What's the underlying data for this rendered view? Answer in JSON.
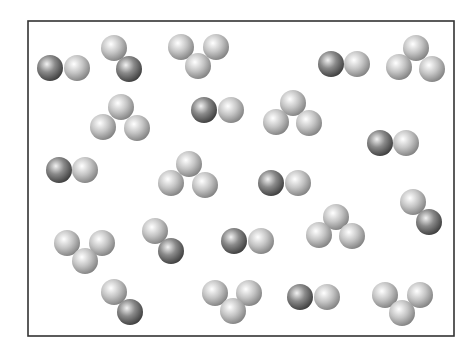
{
  "diagram": {
    "type": "particle-box",
    "box": {
      "x": 28,
      "y": 21,
      "width": 426,
      "height": 315,
      "stroke": "#333333"
    },
    "atom_radius": 13,
    "atom_types": {
      "dark": {
        "highlight": "#f2f2f2",
        "mid": "#8a8a8a",
        "edge": "#3a3a3a"
      },
      "light": {
        "highlight": "#ffffff",
        "mid": "#c4c4c4",
        "edge": "#7e7e7e"
      }
    },
    "molecules": [
      {
        "id": "m1",
        "kind": "diatomic-AB",
        "atoms": [
          {
            "x": 50,
            "y": 68,
            "t": "dark"
          },
          {
            "x": 77,
            "y": 68,
            "t": "light"
          }
        ]
      },
      {
        "id": "m2",
        "kind": "diatomic-AB",
        "atoms": [
          {
            "x": 114,
            "y": 48,
            "t": "light"
          },
          {
            "x": 129,
            "y": 69,
            "t": "dark"
          }
        ]
      },
      {
        "id": "m3",
        "kind": "triatomic-B3",
        "atoms": [
          {
            "x": 181,
            "y": 47,
            "t": "light"
          },
          {
            "x": 216,
            "y": 47,
            "t": "light"
          },
          {
            "x": 198,
            "y": 66,
            "t": "light"
          }
        ]
      },
      {
        "id": "m4",
        "kind": "diatomic-AB",
        "atoms": [
          {
            "x": 331,
            "y": 64,
            "t": "dark"
          },
          {
            "x": 357,
            "y": 64,
            "t": "light"
          }
        ]
      },
      {
        "id": "m5",
        "kind": "triatomic-B3",
        "atoms": [
          {
            "x": 416,
            "y": 48,
            "t": "light"
          },
          {
            "x": 399,
            "y": 67,
            "t": "light"
          },
          {
            "x": 432,
            "y": 69,
            "t": "light"
          }
        ]
      },
      {
        "id": "m6",
        "kind": "triatomic-B3",
        "atoms": [
          {
            "x": 121,
            "y": 107,
            "t": "light"
          },
          {
            "x": 103,
            "y": 127,
            "t": "light"
          },
          {
            "x": 137,
            "y": 128,
            "t": "light"
          }
        ]
      },
      {
        "id": "m7",
        "kind": "diatomic-AB",
        "atoms": [
          {
            "x": 204,
            "y": 110,
            "t": "dark"
          },
          {
            "x": 231,
            "y": 110,
            "t": "light"
          }
        ]
      },
      {
        "id": "m8",
        "kind": "triatomic-B3",
        "atoms": [
          {
            "x": 293,
            "y": 103,
            "t": "light"
          },
          {
            "x": 276,
            "y": 122,
            "t": "light"
          },
          {
            "x": 309,
            "y": 123,
            "t": "light"
          }
        ]
      },
      {
        "id": "m9",
        "kind": "diatomic-AB",
        "atoms": [
          {
            "x": 380,
            "y": 143,
            "t": "dark"
          },
          {
            "x": 406,
            "y": 143,
            "t": "light"
          }
        ]
      },
      {
        "id": "m10",
        "kind": "diatomic-AB",
        "atoms": [
          {
            "x": 59,
            "y": 170,
            "t": "dark"
          },
          {
            "x": 85,
            "y": 170,
            "t": "light"
          }
        ]
      },
      {
        "id": "m11",
        "kind": "triatomic-B3",
        "atoms": [
          {
            "x": 189,
            "y": 164,
            "t": "light"
          },
          {
            "x": 171,
            "y": 183,
            "t": "light"
          },
          {
            "x": 205,
            "y": 185,
            "t": "light"
          }
        ]
      },
      {
        "id": "m12",
        "kind": "diatomic-AB",
        "atoms": [
          {
            "x": 271,
            "y": 183,
            "t": "dark"
          },
          {
            "x": 298,
            "y": 183,
            "t": "light"
          }
        ]
      },
      {
        "id": "m13",
        "kind": "triatomic-B3",
        "atoms": [
          {
            "x": 336,
            "y": 217,
            "t": "light"
          },
          {
            "x": 319,
            "y": 235,
            "t": "light"
          },
          {
            "x": 352,
            "y": 236,
            "t": "light"
          }
        ]
      },
      {
        "id": "m14",
        "kind": "diatomic-AB",
        "atoms": [
          {
            "x": 413,
            "y": 202,
            "t": "light"
          },
          {
            "x": 429,
            "y": 222,
            "t": "dark"
          }
        ]
      },
      {
        "id": "m15",
        "kind": "triatomic-B3",
        "atoms": [
          {
            "x": 67,
            "y": 243,
            "t": "light"
          },
          {
            "x": 102,
            "y": 243,
            "t": "light"
          },
          {
            "x": 85,
            "y": 261,
            "t": "light"
          }
        ]
      },
      {
        "id": "m16",
        "kind": "diatomic-AB",
        "atoms": [
          {
            "x": 155,
            "y": 231,
            "t": "light"
          },
          {
            "x": 171,
            "y": 251,
            "t": "dark"
          }
        ]
      },
      {
        "id": "m17",
        "kind": "diatomic-AB",
        "atoms": [
          {
            "x": 234,
            "y": 241,
            "t": "dark"
          },
          {
            "x": 261,
            "y": 241,
            "t": "light"
          }
        ]
      },
      {
        "id": "m18",
        "kind": "diatomic-AB",
        "atoms": [
          {
            "x": 114,
            "y": 292,
            "t": "light"
          },
          {
            "x": 130,
            "y": 312,
            "t": "dark"
          }
        ]
      },
      {
        "id": "m19",
        "kind": "triatomic-B3",
        "atoms": [
          {
            "x": 215,
            "y": 293,
            "t": "light"
          },
          {
            "x": 249,
            "y": 293,
            "t": "light"
          },
          {
            "x": 233,
            "y": 311,
            "t": "light"
          }
        ]
      },
      {
        "id": "m20",
        "kind": "diatomic-AB",
        "atoms": [
          {
            "x": 300,
            "y": 297,
            "t": "dark"
          },
          {
            "x": 327,
            "y": 297,
            "t": "light"
          }
        ]
      },
      {
        "id": "m21",
        "kind": "triatomic-B3",
        "atoms": [
          {
            "x": 385,
            "y": 295,
            "t": "light"
          },
          {
            "x": 420,
            "y": 295,
            "t": "light"
          },
          {
            "x": 402,
            "y": 313,
            "t": "light"
          }
        ]
      }
    ],
    "counts": {
      "diatomic_AB": 11,
      "triatomic_B3": 10,
      "total_molecules": 21
    }
  }
}
